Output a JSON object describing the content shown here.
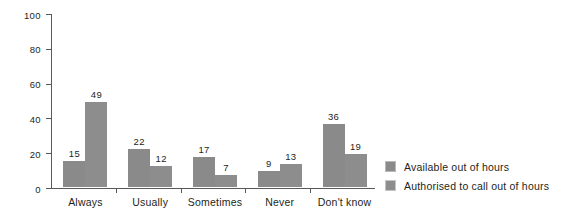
{
  "chart_data": {
    "type": "bar",
    "title": "",
    "xlabel": "",
    "ylabel": "",
    "ylim": [
      0,
      100
    ],
    "yticks": [
      0,
      20,
      40,
      60,
      80,
      100
    ],
    "grid": false,
    "legend_position": "right",
    "categories": [
      "Always",
      "Usually",
      "Sometimes",
      "Never",
      "Don't know"
    ],
    "series": [
      {
        "name": "Available out of hours",
        "color": "#8a8a8a",
        "values": [
          15,
          22,
          17,
          9,
          36
        ]
      },
      {
        "name": "Authorised to call out of hours",
        "color": "#8d8d8d",
        "values": [
          49,
          12,
          7,
          13,
          19
        ]
      }
    ]
  },
  "axis": {
    "tick_labels": [
      "0",
      "20",
      "40",
      "60",
      "80",
      "100"
    ]
  },
  "legend": {
    "items": [
      {
        "label": "Available out of hours"
      },
      {
        "label": "Authorised to call out of hours"
      }
    ]
  }
}
